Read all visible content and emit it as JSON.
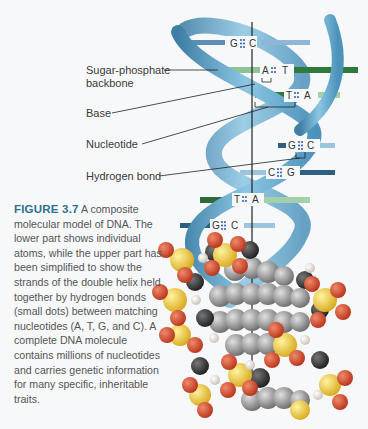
{
  "figure": {
    "number_label": "FIGURE 3.7",
    "caption": "A composite molecular model of DNA. The lower part shows individual atoms, while the upper part has been simplified to show the strands of the double helix held together by hydrogen bonds (small dots) between matching nucleotides (A, T, G, and C). A complete DNA molecule contains millions of nucleotides and carries genetic information for many specific, inheritable traits."
  },
  "labels": {
    "backbone_line1": "Sugar-phosphate",
    "backbone_line2": "backbone",
    "base": "Base",
    "nucleotide": "Nucleotide",
    "hydrogen_bond": "Hydrogen bond"
  },
  "base_pairs": [
    {
      "left": "G",
      "right": "C",
      "color": "#5b8db5"
    },
    {
      "left": "A",
      "right": "T",
      "color": "#4f9a57"
    },
    {
      "left": "T",
      "right": "A",
      "color": "#3d7f45"
    },
    {
      "left": "G",
      "right": "C",
      "color": "#5b8db5"
    },
    {
      "left": "C",
      "right": "G",
      "color": "#5b8db5"
    },
    {
      "left": "T",
      "right": "A",
      "color": "#3d7f45"
    },
    {
      "left": "G",
      "right": "C",
      "color": "#5b8db5"
    }
  ],
  "colors": {
    "backbone": "#6fb0d3",
    "backbone_dark": "#3f7fa6",
    "caption_heading": "#2e6f8e",
    "oxygen": "#d0452a",
    "phosphorus": "#f0cf3a",
    "carbon": "#8c8c8c",
    "hydrogen": "#f2ece6"
  }
}
